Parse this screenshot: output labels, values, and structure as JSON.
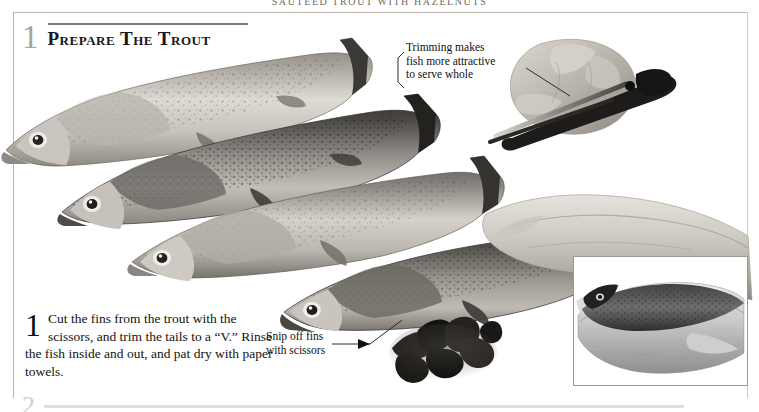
{
  "page": {
    "running_head": "Sautéed Trout with Hazelnuts",
    "background_color": "#ffffff",
    "rule_color": "#b9b5ad"
  },
  "step_heading": {
    "number": "1",
    "title": "Prepare the Trout",
    "number_color": "#a9a49b",
    "rule_color": "#7e7a73"
  },
  "callouts": [
    {
      "name": "trimming-callout",
      "text": "Trimming makes\nfish more attractive\nto serve whole"
    },
    {
      "name": "snip-callout",
      "text": "Snip off fins\nwith scissors"
    }
  ],
  "instruction": {
    "number": "1",
    "text": "Cut the fins from the trout with the scissors, and trim the tails to a “V.” Rinse the fish inside and out, and pat dry with paper towels."
  },
  "photos": {
    "main": {
      "alt": "Four whole rainbow trout arranged diagonally, with hands trimming a trout tail using kitchen scissors",
      "fish_count": 4
    },
    "fin_pile": {
      "alt": "Pile of dark trimmed trout fins"
    },
    "inset": {
      "alt": "Two hands cradling a trimmed trout",
      "border_color": "#9b968e"
    }
  },
  "next_step": {
    "number": "2",
    "rule_color": "#e3e0da"
  }
}
